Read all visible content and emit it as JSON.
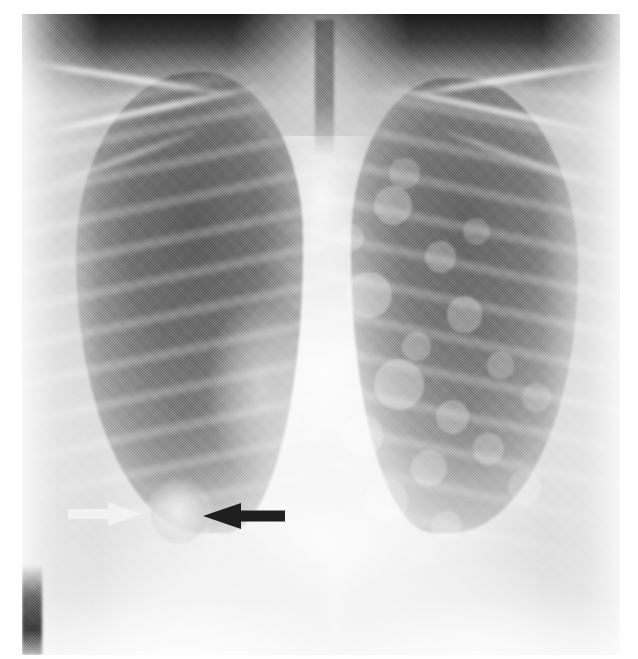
{
  "figure": {
    "kind": "chest-radiograph",
    "view": "posteroanterior",
    "canvas": {
      "width": 638,
      "height": 659
    },
    "plate": {
      "x": 22,
      "y": 14,
      "width": 598,
      "height": 641
    },
    "background_color": "#ffffff",
    "film_base_color": "#e8e8e8",
    "apex_color": "#1a1a1a",
    "mediastinum_color": "#fbfbfb",
    "lung_color": "#6a6a6a"
  },
  "marker": {
    "label": "",
    "note": "faint film marker in dark right apex"
  },
  "annotations": {
    "arrows": [
      {
        "name": "white-arrow",
        "color": "#f2f2f2",
        "direction": "right",
        "tail_x": 68,
        "tip_x": 142,
        "center_y": 514,
        "shaft_height": 10,
        "head_length": 34,
        "head_height": 24,
        "points_to": "nodular opacity, right lower lung zone"
      },
      {
        "name": "black-arrow",
        "color": "#1f1f1f",
        "direction": "left",
        "tail_x": 285,
        "tip_x": 203,
        "center_y": 516,
        "shaft_height": 11,
        "head_length": 38,
        "head_height": 26,
        "points_to": "nodular opacity, right lower lung zone"
      }
    ],
    "finding": {
      "name": "pulmonary-nodule",
      "center_x": 175,
      "center_y": 512,
      "diameter": 58,
      "region": "right lower lung zone / right cardiophrenic angle"
    }
  },
  "anatomy": {
    "regions": [
      {
        "name": "right-lung-field",
        "side": "image-left"
      },
      {
        "name": "left-lung-field",
        "side": "image-right"
      },
      {
        "name": "mediastinum",
        "side": "center"
      },
      {
        "name": "trachea",
        "side": "center"
      },
      {
        "name": "right-hemidiaphragm",
        "side": "image-left"
      },
      {
        "name": "left-hemidiaphragm",
        "side": "image-right"
      },
      {
        "name": "clavicles",
        "side": "both"
      },
      {
        "name": "rib-cage",
        "side": "both"
      }
    ]
  },
  "nodule_field": {
    "note": "scattered nodular opacities, left lung (image right)",
    "spots": [
      {
        "x": 62,
        "y": 30,
        "r": 3.2,
        "o": 0.55
      },
      {
        "x": 70,
        "y": 38,
        "r": 2.6,
        "o": 0.5
      },
      {
        "x": 58,
        "y": 44,
        "r": 3.8,
        "o": 0.62
      },
      {
        "x": 66,
        "y": 52,
        "r": 2.4,
        "o": 0.48
      },
      {
        "x": 74,
        "y": 47,
        "r": 3.0,
        "o": 0.52
      },
      {
        "x": 63,
        "y": 58,
        "r": 4.2,
        "o": 0.6
      },
      {
        "x": 72,
        "y": 63,
        "r": 2.8,
        "o": 0.5
      },
      {
        "x": 80,
        "y": 55,
        "r": 2.2,
        "o": 0.42
      },
      {
        "x": 57,
        "y": 66,
        "r": 3.4,
        "o": 0.55
      },
      {
        "x": 68,
        "y": 71,
        "r": 3.0,
        "o": 0.5
      },
      {
        "x": 78,
        "y": 68,
        "r": 2.6,
        "o": 0.45
      },
      {
        "x": 61,
        "y": 76,
        "r": 3.6,
        "o": 0.5
      },
      {
        "x": 71,
        "y": 80,
        "r": 2.4,
        "o": 0.44
      },
      {
        "x": 84,
        "y": 74,
        "r": 2.8,
        "o": 0.4
      },
      {
        "x": 55,
        "y": 35,
        "r": 2.2,
        "o": 0.46
      },
      {
        "x": 86,
        "y": 60,
        "r": 2.4,
        "o": 0.38
      },
      {
        "x": 64,
        "y": 25,
        "r": 2.6,
        "o": 0.44
      },
      {
        "x": 76,
        "y": 34,
        "r": 2.2,
        "o": 0.4
      }
    ]
  }
}
